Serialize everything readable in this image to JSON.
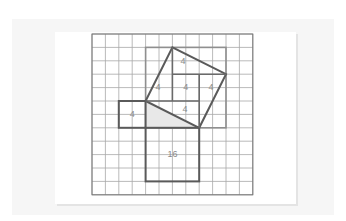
{
  "figure": {
    "grid": {
      "columns": 12,
      "rows": 12
    },
    "colors": {
      "grid_line": "#a8a8a8",
      "shape_stroke": "#5a5a5a",
      "outer_square_stroke": "#8f8f8f",
      "triangle_fill": "#e8e8e8",
      "label": "#8a8a8a"
    },
    "labels": {
      "small_square": "4",
      "bottom_square": "16",
      "tilted_top_triangle": "4",
      "tilted_left_triangle": "4",
      "tilted_center_square": "4",
      "tilted_right_triangle": "4",
      "tilted_bottom_triangle": "4"
    },
    "shapes": {
      "right_triangle": [
        [
          4,
          5
        ],
        [
          4,
          7
        ],
        [
          8,
          7
        ]
      ],
      "small_square": [
        [
          2,
          5
        ],
        [
          4,
          5
        ],
        [
          4,
          7
        ],
        [
          2,
          7
        ]
      ],
      "bottom_square": [
        [
          4,
          7
        ],
        [
          8,
          7
        ],
        [
          8,
          11
        ],
        [
          4,
          11
        ]
      ],
      "tilted_square": [
        [
          4,
          5
        ],
        [
          6,
          1
        ],
        [
          10,
          3
        ],
        [
          8,
          7
        ]
      ],
      "enclosing_square": [
        [
          4,
          1
        ],
        [
          10,
          1
        ],
        [
          10,
          7
        ],
        [
          4,
          7
        ]
      ]
    }
  }
}
